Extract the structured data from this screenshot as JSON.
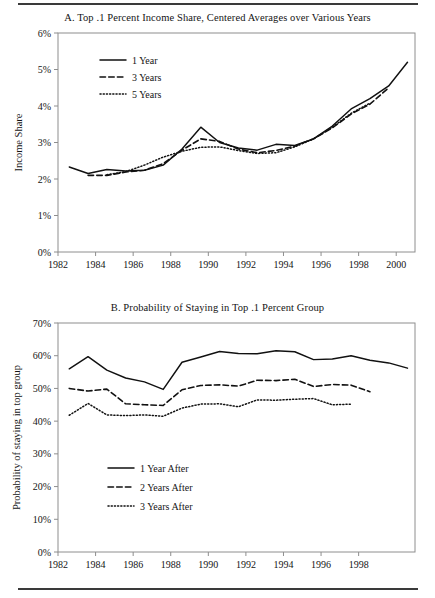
{
  "figure": {
    "top_rule": "horizontal-rule",
    "bottom_rule": "horizontal-rule"
  },
  "panel_a": {
    "title": "A. Top .1 Percent Income Share, Centered Averages over Various Years",
    "ylabel": "Income Share",
    "ytick_labels": [
      "0%",
      "1%",
      "2%",
      "3%",
      "4%",
      "5%",
      "6%"
    ],
    "xtick_labels": [
      "1982",
      "1984",
      "1986",
      "1988",
      "1990",
      "1992",
      "1994",
      "1996",
      "1998",
      "2000"
    ],
    "legend": [
      {
        "label": "1 Year",
        "style": "solid"
      },
      {
        "label": "3 Years",
        "style": "dashed"
      },
      {
        "label": "5 Years",
        "style": "dotted"
      }
    ]
  },
  "panel_b": {
    "title": "B. Probability of Staying in Top .1 Percent Group",
    "ylabel": "Probability of staying in top group",
    "ytick_labels": [
      "0%",
      "10%",
      "20%",
      "30%",
      "40%",
      "50%",
      "60%",
      "70%"
    ],
    "xtick_labels": [
      "1982",
      "1984",
      "1986",
      "1988",
      "1990",
      "1992",
      "1994",
      "1996",
      "1998"
    ],
    "legend": [
      {
        "label": "1 Year After",
        "style": "solid"
      },
      {
        "label": "2 Years After",
        "style": "dashed"
      },
      {
        "label": "3 Years After",
        "style": "dotted"
      }
    ]
  },
  "chart_data": [
    {
      "type": "line",
      "panel": "A",
      "title": "A. Top .1 Percent Income Share, Centered Averages over Various Years",
      "xlabel": "",
      "ylabel": "Income Share",
      "xlim": [
        1982,
        2001
      ],
      "ylim": [
        0,
        6
      ],
      "ytick_values": [
        0,
        1,
        2,
        3,
        4,
        5,
        6
      ],
      "ytick_labels": [
        "0%",
        "1%",
        "2%",
        "3%",
        "4%",
        "5%",
        "6%"
      ],
      "xtick_values": [
        1982,
        1984,
        1986,
        1988,
        1990,
        1992,
        1994,
        1996,
        1998,
        2000
      ],
      "grid": false,
      "legend_position": "upper-left-inside",
      "series": [
        {
          "name": "1 Year",
          "style": "solid",
          "x": [
            1982.6,
            1983.6,
            1984.6,
            1985.6,
            1986.6,
            1987.6,
            1988.6,
            1989.6,
            1990.6,
            1991.6,
            1992.6,
            1993.6,
            1994.6,
            1995.6,
            1996.6,
            1997.6,
            1998.6,
            1999.6,
            2000.6
          ],
          "values": [
            2.33,
            2.15,
            2.26,
            2.22,
            2.24,
            2.38,
            2.82,
            3.42,
            3.0,
            2.85,
            2.79,
            2.95,
            2.92,
            3.1,
            3.45,
            3.92,
            4.2,
            4.55,
            5.2
          ]
        },
        {
          "name": "3 Years",
          "style": "dashed",
          "x": [
            1983.6,
            1984.6,
            1985.6,
            1986.6,
            1987.6,
            1988.6,
            1989.6,
            1990.6,
            1991.6,
            1992.6,
            1993.6,
            1994.6,
            1995.6,
            1996.6,
            1997.6,
            1998.6,
            1999.6
          ],
          "values": [
            2.1,
            2.1,
            2.19,
            2.24,
            2.42,
            2.79,
            3.1,
            3.03,
            2.82,
            2.72,
            2.78,
            2.9,
            3.1,
            3.4,
            3.78,
            4.05,
            4.5
          ]
        },
        {
          "name": "5 Years",
          "style": "dotted",
          "x": [
            1984.6,
            1985.6,
            1986.6,
            1987.6,
            1988.6,
            1989.6,
            1990.6,
            1991.6,
            1992.6,
            1993.6,
            1994.6,
            1995.6,
            1996.6,
            1997.6,
            1998.6
          ],
          "values": [
            2.12,
            2.2,
            2.38,
            2.6,
            2.76,
            2.87,
            2.88,
            2.78,
            2.7,
            2.72,
            2.88,
            3.1,
            3.42,
            3.8,
            4.08
          ]
        }
      ]
    },
    {
      "type": "line",
      "panel": "B",
      "title": "B. Probability of Staying in Top .1 Percent Group",
      "xlabel": "",
      "ylabel": "Probability of staying in top group",
      "xlim": [
        1982,
        2001
      ],
      "ylim": [
        0,
        70
      ],
      "ytick_values": [
        0,
        10,
        20,
        30,
        40,
        50,
        60,
        70
      ],
      "ytick_labels": [
        "0%",
        "10%",
        "20%",
        "30%",
        "40%",
        "50%",
        "60%",
        "70%"
      ],
      "xtick_values": [
        1982,
        1984,
        1986,
        1988,
        1990,
        1992,
        1994,
        1996,
        1998
      ],
      "grid": false,
      "legend_position": "lower-left-inside",
      "series": [
        {
          "name": "1 Year After",
          "style": "solid",
          "x": [
            1982.6,
            1983.6,
            1984.6,
            1985.6,
            1986.6,
            1987.6,
            1988.6,
            1989.6,
            1990.6,
            1991.6,
            1992.6,
            1993.6,
            1994.6,
            1995.6,
            1996.6,
            1997.6,
            1998.6,
            1999.6,
            2000.6
          ],
          "values": [
            56.0,
            59.7,
            55.6,
            53.2,
            52.0,
            49.7,
            58.0,
            59.6,
            61.3,
            60.7,
            60.6,
            61.5,
            61.2,
            58.8,
            59.0,
            60.0,
            58.6,
            57.8,
            56.2
          ]
        },
        {
          "name": "2 Years After",
          "style": "dashed",
          "x": [
            1982.6,
            1983.6,
            1984.6,
            1985.6,
            1986.6,
            1987.6,
            1988.6,
            1989.6,
            1990.6,
            1991.6,
            1992.6,
            1993.6,
            1994.6,
            1995.6,
            1996.6,
            1997.6,
            1998.6
          ],
          "values": [
            50.0,
            49.2,
            49.8,
            45.3,
            45.0,
            44.8,
            49.6,
            50.9,
            51.1,
            50.7,
            52.5,
            52.4,
            52.8,
            50.6,
            51.2,
            51.0,
            49.0
          ]
        },
        {
          "name": "3 Years After",
          "style": "dotted",
          "x": [
            1982.6,
            1983.6,
            1984.6,
            1985.6,
            1986.6,
            1987.6,
            1988.6,
            1989.6,
            1990.6,
            1991.6,
            1992.6,
            1993.6,
            1994.6,
            1995.6,
            1996.6,
            1997.6
          ],
          "values": [
            41.8,
            45.4,
            41.9,
            41.7,
            41.9,
            41.5,
            44.0,
            45.2,
            45.3,
            44.4,
            46.5,
            46.4,
            46.7,
            46.9,
            45.0,
            45.2
          ]
        }
      ]
    }
  ]
}
